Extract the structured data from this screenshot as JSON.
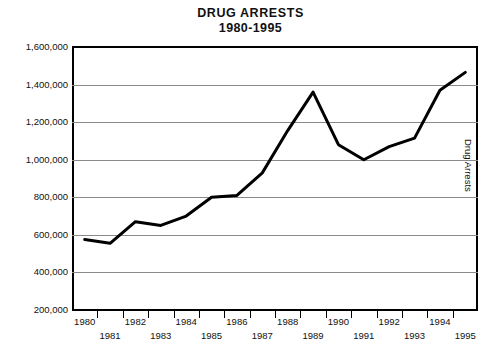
{
  "title": {
    "main": "DRUG ARRESTS",
    "subtitle": "1980-1995"
  },
  "right_axis_title": "Drug Arrests",
  "axes": {
    "y_tick_labels": [
      "1,600,000",
      "1,400,000",
      "1,200,000",
      "1,000,000",
      "800,000",
      "600,000",
      "400,000",
      "200,000"
    ],
    "x_tick_labels_top": [
      "1980",
      "1982",
      "1984",
      "1986",
      "1988",
      "1990",
      "1992",
      "1994"
    ],
    "x_tick_labels_bottom": [
      "1981",
      "1983",
      "1985",
      "1987",
      "1989",
      "1991",
      "1993",
      "1995"
    ]
  },
  "colors": {
    "line": "#000000",
    "grid": "#8a8a8a",
    "axis": "#000000",
    "text": "#111111",
    "background": "#ffffff"
  },
  "chart_data": {
    "type": "line",
    "title": "DRUG ARRESTS 1980-1995",
    "xlabel": "",
    "ylabel": "Drug Arrests",
    "x": [
      1980,
      1981,
      1982,
      1983,
      1984,
      1985,
      1986,
      1987,
      1988,
      1989,
      1990,
      1991,
      1992,
      1993,
      1994,
      1995
    ],
    "categories": [
      "1980",
      "1981",
      "1982",
      "1983",
      "1984",
      "1985",
      "1986",
      "1987",
      "1988",
      "1989",
      "1990",
      "1991",
      "1992",
      "1993",
      "1994",
      "1995"
    ],
    "values": [
      575000,
      555000,
      670000,
      650000,
      700000,
      800000,
      810000,
      930000,
      1155000,
      1360000,
      1080000,
      1000000,
      1070000,
      1115000,
      1370000,
      1465000
    ],
    "series": [
      {
        "name": "Drug Arrests",
        "values": [
          575000,
          555000,
          670000,
          650000,
          700000,
          800000,
          810000,
          930000,
          1155000,
          1360000,
          1080000,
          1000000,
          1070000,
          1115000,
          1370000,
          1465000
        ]
      }
    ],
    "ylim": [
      200000,
      1600000
    ],
    "ytick_step": 200000,
    "yticks": [
      200000,
      400000,
      600000,
      800000,
      1000000,
      1200000,
      1400000,
      1600000
    ],
    "xlim": [
      1980,
      1995
    ],
    "grid": "horizontal",
    "legend": "none",
    "annotations": []
  }
}
